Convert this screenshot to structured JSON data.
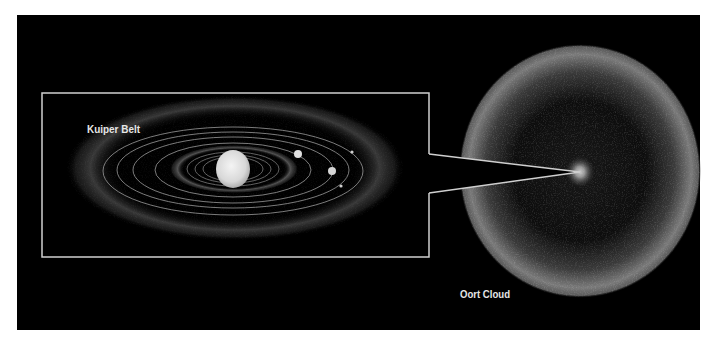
{
  "figure": {
    "background_color": "#000000",
    "page_color": "#ffffff",
    "frame_color": "#cfcfcf",
    "labels": {
      "kuiper_belt": "Kuiper Belt",
      "oort_cloud": "Oort Cloud"
    },
    "solar_system": {
      "sun": "sun",
      "planets_visible": 4,
      "orbits_visible": 7
    }
  }
}
